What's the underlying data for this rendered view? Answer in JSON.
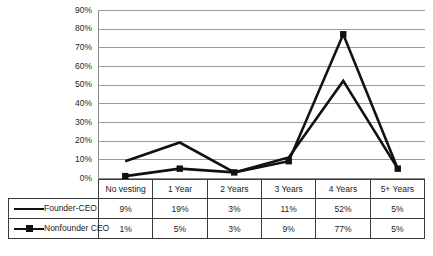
{
  "chart_data": {
    "type": "line",
    "title": "",
    "xlabel": "",
    "ylabel": "",
    "categories": [
      "No vesting",
      "1 Year",
      "2 Years",
      "3 Years",
      "4 Years",
      "5+ Years"
    ],
    "series": [
      {
        "name": "Founder-CEO",
        "values": [
          9,
          19,
          3,
          11,
          52,
          5
        ],
        "marker": "none"
      },
      {
        "name": "Nonfounder CEO",
        "values": [
          1,
          5,
          3,
          9,
          77,
          5
        ],
        "marker": "square"
      }
    ],
    "value_labels": {
      "Founder-CEO": [
        "9%",
        "19%",
        "3%",
        "11%",
        "52%",
        "5%"
      ],
      "Nonfounder CEO": [
        "1%",
        "5%",
        "3%",
        "9%",
        "77%",
        "5%"
      ]
    },
    "ylim": [
      0,
      90
    ],
    "ytick_step": 10,
    "ytick_labels": [
      "0%",
      "10%",
      "20%",
      "30%",
      "40%",
      "50%",
      "60%",
      "70%",
      "80%",
      "90%"
    ],
    "grid": true,
    "legend_position": "data-table-left",
    "colors": {
      "series_line": "#111111",
      "gridline": "#9a9a9a",
      "axis": "#8a8a8a",
      "table_border": "#3a3a3a",
      "text": "#1a1a1a",
      "background": "#ffffff"
    }
  }
}
